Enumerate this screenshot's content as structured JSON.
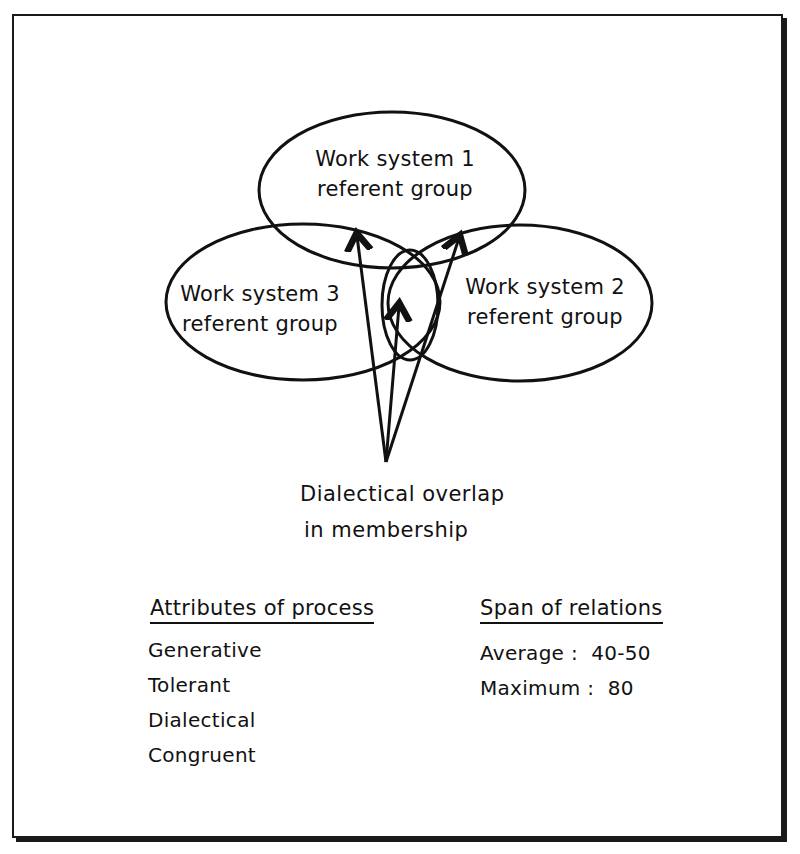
{
  "diagram": {
    "nodes": [
      {
        "id": "ws1",
        "line1": "Work system 1",
        "line2": "referent group"
      },
      {
        "id": "ws2",
        "line1": "Work system 2",
        "line2": "referent group"
      },
      {
        "id": "ws3",
        "line1": "Work system 3",
        "line2": "referent group"
      }
    ],
    "overlap_caption": {
      "line1": "Dialectical overlap",
      "line2": "in membership"
    },
    "arrows": [
      {
        "from": "overlap_caption",
        "to": "ws1/ws3 overlap"
      },
      {
        "from": "overlap_caption",
        "to": "ws1/ws2/ws3 center overlap"
      },
      {
        "from": "overlap_caption",
        "to": "ws1/ws2 overlap"
      }
    ]
  },
  "attributes": {
    "title": "Attributes of process",
    "items": [
      "Generative",
      "Tolerant",
      "Dialectical",
      "Congruent"
    ]
  },
  "span": {
    "title": "Span of relations",
    "items": [
      "Average :  40-50",
      "Maximum :  80"
    ]
  }
}
